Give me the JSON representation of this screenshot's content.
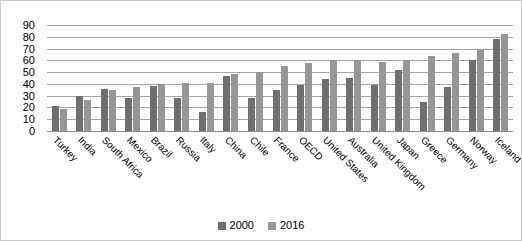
{
  "chart_data": {
    "type": "bar",
    "title": "",
    "subtitle": "",
    "xlabel": "",
    "ylabel": "",
    "ylim": [
      0,
      90
    ],
    "ytick_step": 10,
    "yticks": [
      90,
      80,
      70,
      60,
      50,
      40,
      30,
      20,
      10,
      0
    ],
    "grid": true,
    "legend_position": "bottom",
    "categories": [
      "Turkey",
      "India",
      "South Africa",
      "Mexico",
      "Brazil",
      "Russia",
      "Italy",
      "China",
      "Chile",
      "France",
      "OECD",
      "United States",
      "Australia",
      "United Kingdom",
      "Japan",
      "Greece",
      "Germany",
      "Norway",
      "Iceland"
    ],
    "series": [
      {
        "name": "2000",
        "color": "#6f6f6f",
        "values": [
          21,
          30,
          36,
          28,
          38,
          28,
          16,
          47,
          28,
          35,
          39,
          44,
          45,
          39,
          52,
          25,
          37,
          60,
          78
        ]
      },
      {
        "name": "2016",
        "color": "#969696",
        "values": [
          19,
          26,
          35,
          37,
          40,
          41,
          41,
          48,
          50,
          55,
          58,
          60,
          60,
          59,
          60,
          64,
          66,
          69,
          82
        ]
      }
    ]
  },
  "legend": {
    "items": [
      {
        "label": "2000",
        "color": "#6f6f6f"
      },
      {
        "label": "2016",
        "color": "#969696"
      }
    ]
  },
  "colors": {
    "series_2000": "#6f6f6f",
    "series_2016": "#969696",
    "gridline": "#a6a6a6",
    "border": "#c8c8c8",
    "background": "#ffffff",
    "text": "#000000"
  }
}
